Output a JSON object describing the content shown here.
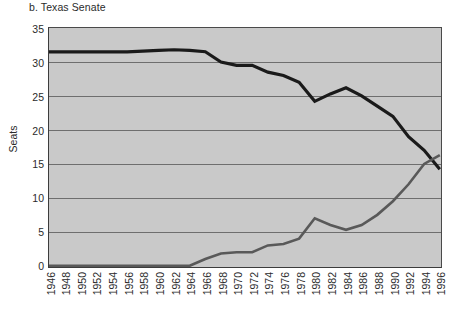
{
  "title": "b. Texas Senate",
  "axes": {
    "ylabel": "Seats",
    "yticks": [
      "0",
      "5",
      "10",
      "15",
      "20",
      "25",
      "30",
      "35"
    ],
    "xticks": [
      "1946",
      "1948",
      "1950",
      "1952",
      "1954",
      "1956",
      "1958",
      "1960",
      "1962",
      "1964",
      "1966",
      "1968",
      "1970",
      "1972",
      "1974",
      "1976",
      "1978",
      "1980",
      "1982",
      "1984",
      "1986",
      "1988",
      "1990",
      "1992",
      "1994",
      "1996"
    ]
  },
  "colors": {
    "plot_background": "#c9c9c9",
    "gridline": "#6e6e6e",
    "axis": "#3c3c3c",
    "series_dark": "#1a1a1a",
    "series_gray": "#595959",
    "text": "#2b2b2b"
  },
  "chart_data": {
    "type": "line",
    "title": "b. Texas Senate",
    "xlabel": "",
    "ylabel": "Seats",
    "xlim": [
      1946,
      1996
    ],
    "ylim": [
      0,
      35
    ],
    "yticks": [
      0,
      5,
      10,
      15,
      20,
      25,
      30,
      35
    ],
    "grid": true,
    "legend": "none",
    "x": [
      1946,
      1948,
      1950,
      1952,
      1954,
      1956,
      1958,
      1960,
      1962,
      1964,
      1966,
      1968,
      1970,
      1972,
      1974,
      1976,
      1978,
      1980,
      1982,
      1984,
      1986,
      1988,
      1990,
      1992,
      1994,
      1996
    ],
    "series": [
      {
        "name": "Democrats",
        "color": "#1a1a1a",
        "values": [
          31.5,
          31.5,
          31.5,
          31.5,
          31.5,
          31.5,
          31.6,
          31.7,
          31.8,
          31.7,
          31.5,
          30.0,
          29.5,
          29.5,
          28.5,
          28.0,
          27.0,
          24.2,
          25.3,
          26.2,
          25.0,
          23.5,
          22.0,
          19.0,
          17.0,
          14.2
        ]
      },
      {
        "name": "Republicans",
        "color": "#595959",
        "values": [
          0,
          0,
          0,
          0,
          0,
          0,
          0,
          0,
          0,
          0,
          1.0,
          1.8,
          2.0,
          2.0,
          3.0,
          3.2,
          4.0,
          7.0,
          6.0,
          5.3,
          6.0,
          7.5,
          9.5,
          12.0,
          15.0,
          16.3
        ]
      }
    ]
  }
}
